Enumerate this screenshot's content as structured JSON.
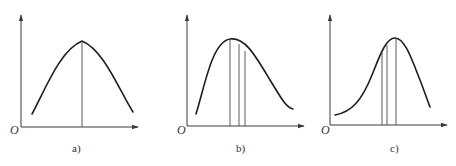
{
  "figure": {
    "panels": [
      {
        "id": "a",
        "caption": "a)",
        "origin_label": "O",
        "shape": "symmetric bell curve",
        "vertical_lines_count": 1
      },
      {
        "id": "b",
        "caption": "b)",
        "origin_label": "O",
        "shape": "right-skewed (positively skewed) curve",
        "vertical_lines_count": 3
      },
      {
        "id": "c",
        "caption": "c)",
        "origin_label": "O",
        "shape": "left-skewed (negatively skewed) curve",
        "vertical_lines_count": 3
      }
    ]
  },
  "colors": {
    "axis": "#3a3a3a",
    "curve": "#1e1e1e",
    "background": "#ffffff"
  }
}
